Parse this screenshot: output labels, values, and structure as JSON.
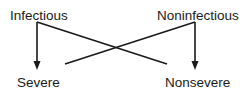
{
  "diagram": {
    "nodes": {
      "infectious": {
        "label": "Infectious"
      },
      "noninfectious": {
        "label": "Noninfectious"
      },
      "severe": {
        "label": "Severe"
      },
      "nonsevere": {
        "label": "Nonsevere"
      }
    },
    "edges": [
      {
        "from": "Infectious",
        "to": "Severe",
        "style": "arrow"
      },
      {
        "from": "Infectious",
        "to": "Nonsevere",
        "style": "line-no-arrow"
      },
      {
        "from": "Noninfectious",
        "to": "Nonsevere",
        "style": "arrow"
      },
      {
        "from": "Noninfectious",
        "to": "Severe",
        "style": "line-no-arrow"
      }
    ],
    "colors": {
      "stroke": "#1a1a1a",
      "text": "#1a1a1a",
      "background": "#ffffff"
    }
  }
}
